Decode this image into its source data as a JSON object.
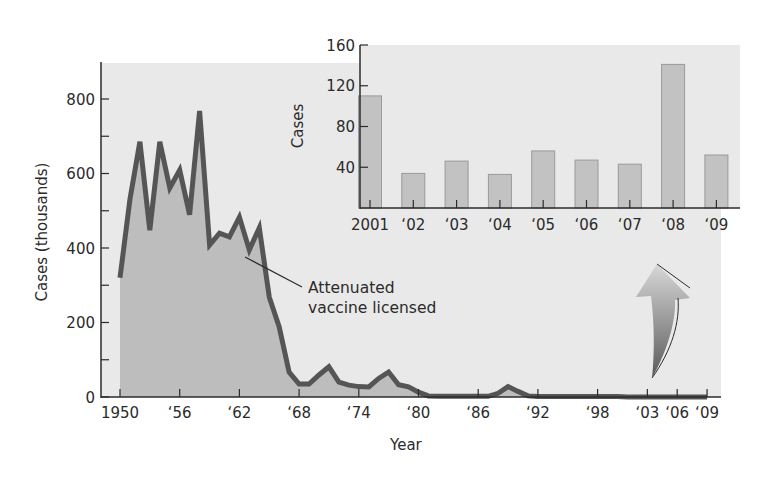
{
  "chart_data": [
    {
      "id": "main",
      "type": "area",
      "title": "",
      "xlabel": "Year",
      "ylabel": "Cases (thousands)",
      "xlim": [
        1950,
        2009
      ],
      "ylim": [
        0,
        900
      ],
      "grid": false,
      "legend": null,
      "x_ticks": [
        {
          "value": 1950,
          "label": "1950"
        },
        {
          "value": 1956,
          "label": "‘56"
        },
        {
          "value": 1962,
          "label": "‘62"
        },
        {
          "value": 1968,
          "label": "‘68"
        },
        {
          "value": 1974,
          "label": "‘74"
        },
        {
          "value": 1980,
          "label": "‘80"
        },
        {
          "value": 1986,
          "label": "‘86"
        },
        {
          "value": 1992,
          "label": "‘92"
        },
        {
          "value": 1998,
          "label": "‘98"
        },
        {
          "value": 2003,
          "label": "‘03"
        },
        {
          "value": 2006,
          "label": "‘06"
        },
        {
          "value": 2009,
          "label": "‘09"
        }
      ],
      "y_ticks": [
        {
          "value": 0,
          "label": "0"
        },
        {
          "value": 100,
          "label": ""
        },
        {
          "value": 200,
          "label": "200"
        },
        {
          "value": 300,
          "label": ""
        },
        {
          "value": 400,
          "label": "400"
        },
        {
          "value": 500,
          "label": ""
        },
        {
          "value": 600,
          "label": "600"
        },
        {
          "value": 700,
          "label": ""
        },
        {
          "value": 800,
          "label": "800"
        }
      ],
      "x": [
        1950,
        1951,
        1952,
        1953,
        1954,
        1955,
        1956,
        1957,
        1958,
        1959,
        1960,
        1961,
        1962,
        1963,
        1964,
        1965,
        1966,
        1967,
        1968,
        1969,
        1970,
        1971,
        1972,
        1973,
        1974,
        1975,
        1976,
        1977,
        1978,
        1979,
        1980,
        1981,
        1982,
        1983,
        1984,
        1985,
        1986,
        1987,
        1988,
        1989,
        1990,
        1991,
        1992,
        1993,
        1994,
        1995,
        1996,
        1997,
        1998,
        1999,
        2000,
        2001,
        2002,
        2003,
        2004,
        2005,
        2006,
        2007,
        2008,
        2009
      ],
      "series": [
        {
          "name": "Measles cases (thousands)",
          "values": [
            320,
            530,
            685,
            448,
            685,
            561,
            609,
            489,
            768,
            408,
            440,
            430,
            483,
            395,
            454,
            268,
            188,
            67,
            35,
            35,
            59,
            81,
            40,
            32,
            28,
            27,
            50,
            67,
            33,
            27,
            13,
            3,
            2,
            2,
            2,
            2,
            2,
            2,
            10,
            28,
            15,
            3,
            1,
            1,
            1,
            1,
            1,
            1,
            1,
            1,
            1,
            0.1,
            0.03,
            0.05,
            0.03,
            0.06,
            0.05,
            0.04,
            0.14,
            0.05
          ]
        }
      ],
      "annotations": [
        {
          "text_line1": "Attenuated",
          "text_line2": "vaccine licensed",
          "points_to_year": 1963
        }
      ]
    },
    {
      "id": "inset",
      "type": "bar",
      "title": "",
      "xlabel": "",
      "ylabel": "Cases",
      "ylim": [
        0,
        160
      ],
      "grid": false,
      "categories": [
        "2001",
        "‘02",
        "‘03",
        "‘04",
        "‘05",
        "‘06",
        "‘07",
        "‘08",
        "‘09"
      ],
      "values": [
        110,
        34,
        46,
        33,
        56,
        47,
        43,
        141,
        52
      ],
      "y_ticks": [
        {
          "value": 40,
          "label": "40"
        },
        {
          "value": 80,
          "label": "80"
        },
        {
          "value": 120,
          "label": "120"
        },
        {
          "value": 160,
          "label": "160"
        }
      ]
    }
  ],
  "colors": {
    "panel_bg": "#e9e9e9",
    "area_fill": "#bdbdbd",
    "line": "#555555",
    "bar_fill": "#c2c2c2",
    "bar_stroke": "#9a9a9a",
    "axis": "#2b2b2b",
    "arrow_light": "#d6d6d6",
    "arrow_dark": "#5a5a5a"
  }
}
